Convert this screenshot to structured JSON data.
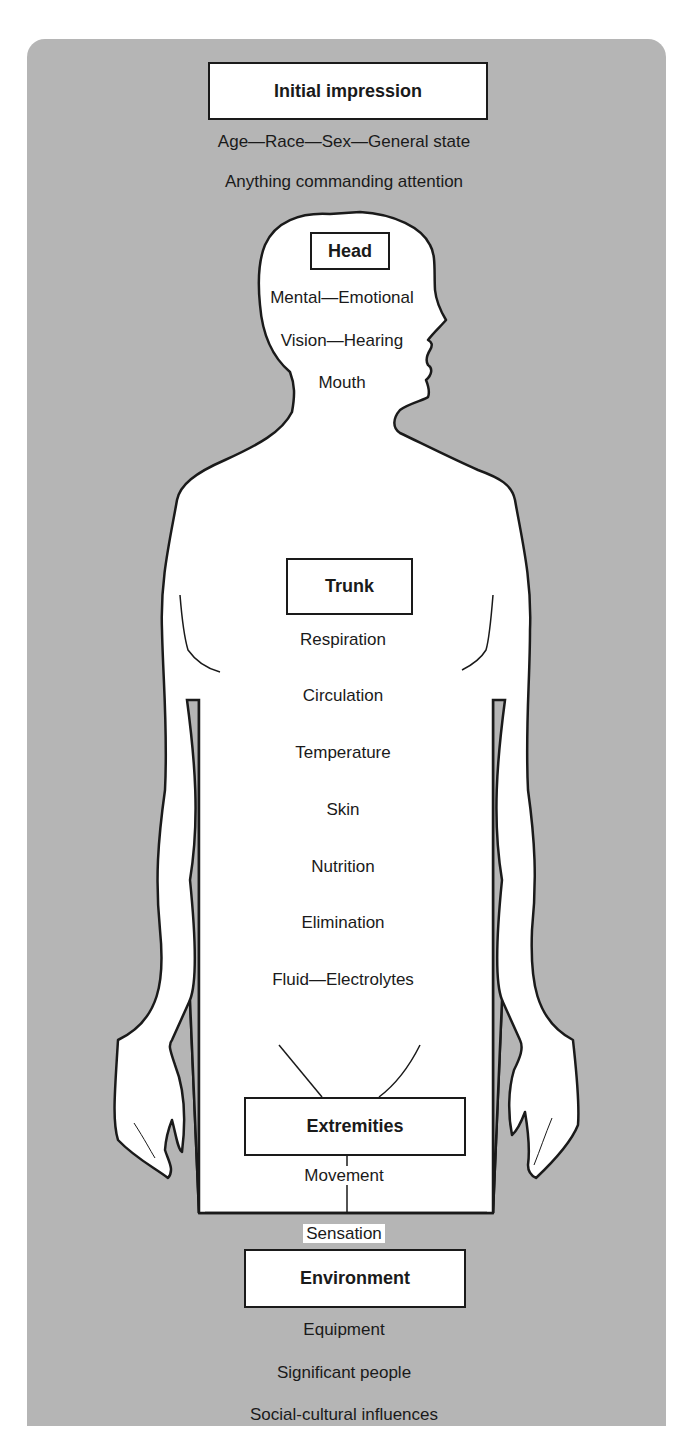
{
  "diagram": {
    "colors": {
      "background": "#b5b5b5",
      "body_fill": "#ffffff",
      "outline": "#1a1a1a"
    },
    "sections": [
      {
        "title": "Initial impression",
        "items": [
          "Age—Race—Sex—General state",
          "Anything commanding attention"
        ]
      },
      {
        "title": "Head",
        "items": [
          "Mental—Emotional",
          "Vision—Hearing",
          "Mouth"
        ]
      },
      {
        "title": "Trunk",
        "items": [
          "Respiration",
          "Circulation",
          "Temperature",
          "Skin",
          "Nutrition",
          "Elimination",
          "Fluid—Electrolytes"
        ]
      },
      {
        "title": "Extremities",
        "items": [
          "Movement",
          "Sensation"
        ]
      },
      {
        "title": "Environment",
        "items": [
          "Equipment",
          "Significant people",
          "Social-cultural influences"
        ]
      }
    ]
  }
}
